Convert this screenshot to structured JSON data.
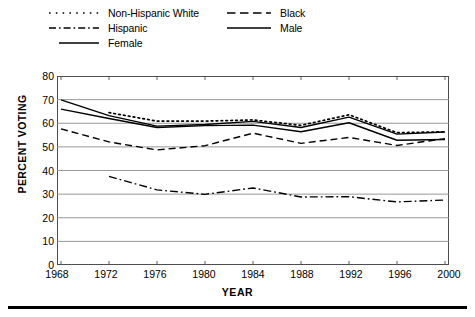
{
  "chart_data": {
    "type": "line",
    "title": "",
    "xlabel": "YEAR",
    "ylabel": "PERCENT VOTING",
    "x": [
      1968,
      1972,
      1976,
      1980,
      1984,
      1988,
      1992,
      1996,
      2000
    ],
    "xlim": [
      1968,
      2000
    ],
    "ylim": [
      0,
      80
    ],
    "ytick_step": 10,
    "xtick_labels": [
      "1968",
      "1972",
      "1976",
      "1980",
      "1984",
      "1988",
      "1992",
      "1996",
      "2000"
    ],
    "ytick_labels": [
      "0",
      "10",
      "20",
      "30",
      "40",
      "50",
      "60",
      "70",
      "80"
    ],
    "grid": true,
    "legend_position": "above-plot",
    "series": [
      {
        "name": "Non-Hispanic White",
        "style": "dotted",
        "color": "#000000",
        "x": [
          1968,
          1972,
          1976,
          1980,
          1984,
          1988,
          1992,
          1996,
          2000
        ],
        "values": [
          null,
          64.5,
          60.9,
          60.9,
          61.4,
          59.1,
          63.6,
          56.0,
          56.4
        ]
      },
      {
        "name": "Black",
        "style": "dashed",
        "color": "#000000",
        "x": [
          1968,
          1972,
          1976,
          1980,
          1984,
          1988,
          1992,
          1996,
          2000
        ],
        "values": [
          57.6,
          52.1,
          48.7,
          50.5,
          55.8,
          51.5,
          54.0,
          50.6,
          53.5
        ]
      },
      {
        "name": "Hispanic",
        "style": "dash-dot",
        "color": "#000000",
        "x": [
          1968,
          1972,
          1976,
          1980,
          1984,
          1988,
          1992,
          1996,
          2000
        ],
        "values": [
          null,
          37.5,
          31.8,
          29.9,
          32.6,
          28.8,
          28.9,
          26.7,
          27.5
        ]
      },
      {
        "name": "Male",
        "style": "solid",
        "color": "#000000",
        "x": [
          1968,
          1972,
          1976,
          1980,
          1984,
          1988,
          1992,
          1996,
          2000
        ],
        "values": [
          66.0,
          62.0,
          58.2,
          59.0,
          59.2,
          56.4,
          60.2,
          52.8,
          53.1
        ]
      },
      {
        "name": "Female",
        "style": "solid",
        "color": "#000000",
        "x": [
          1968,
          1972,
          1976,
          1980,
          1984,
          1988,
          1992,
          1996,
          2000
        ],
        "values": [
          69.9,
          63.2,
          58.8,
          59.5,
          60.8,
          58.2,
          62.6,
          55.4,
          56.3
        ]
      }
    ]
  },
  "legend": {
    "items": [
      {
        "label": "Non-Hispanic White",
        "style": "dotted"
      },
      {
        "label": "Hispanic",
        "style": "dash-dot"
      },
      {
        "label": "Female",
        "style": "solid"
      },
      {
        "label": "Black",
        "style": "dashed"
      },
      {
        "label": "Male",
        "style": "solid"
      }
    ]
  },
  "axes": {
    "x_title": "YEAR",
    "y_title": "PERCENT VOTING"
  },
  "colors": {
    "line": "#000000",
    "grid": "#8c8c8c",
    "frame": "#4d4d4d",
    "background": "#ffffff"
  }
}
